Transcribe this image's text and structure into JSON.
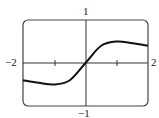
{
  "chart_data": {
    "type": "line",
    "title": "",
    "xlabel": "",
    "ylabel": "",
    "xlim": [
      -2,
      2
    ],
    "ylim": [
      -1,
      1
    ],
    "grid": false,
    "tick_labels": {
      "x_min": "−2",
      "x_max": "2",
      "y_max": "1",
      "y_min": "−1"
    },
    "x_ticks": [
      -1,
      1
    ],
    "series": [
      {
        "name": "f(x)",
        "x": [
          -2,
          -1.5,
          -1,
          -0.5,
          0,
          0.5,
          1,
          1.5,
          2
        ],
        "values": [
          -0.4,
          -0.46,
          -0.5,
          -0.4,
          0,
          0.4,
          0.5,
          0.46,
          0.4
        ]
      }
    ]
  }
}
